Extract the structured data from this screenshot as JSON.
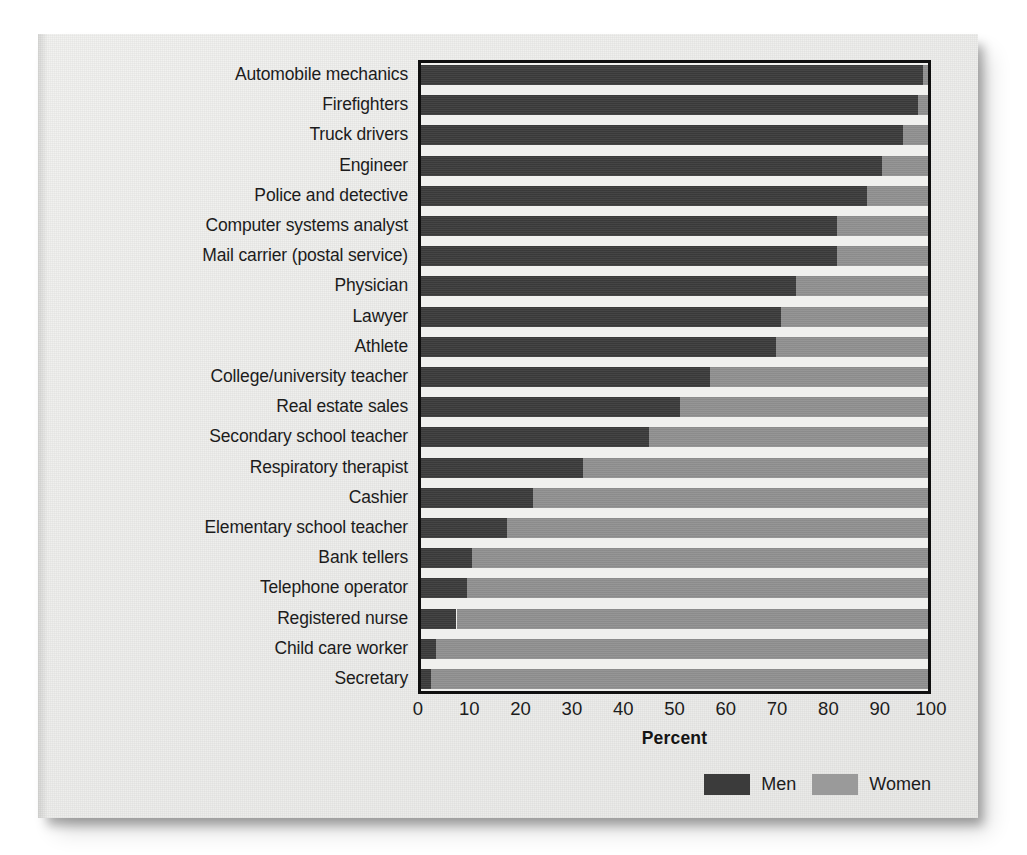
{
  "chart_data": {
    "type": "bar",
    "subtype": "stacked-horizontal-100",
    "title": "",
    "xlabel": "Percent",
    "ylabel": "",
    "xlim": [
      0,
      100
    ],
    "xticks": [
      0,
      10,
      20,
      30,
      40,
      50,
      60,
      70,
      80,
      90,
      100
    ],
    "grid": false,
    "legend_position": "bottom-right",
    "categories": [
      "Automobile mechanics",
      "Firefighters",
      "Truck drivers",
      "Engineer",
      "Police and detective",
      "Computer systems analyst",
      "Mail carrier (postal service)",
      "Physician",
      "Lawyer",
      "Athlete",
      "College/university teacher",
      "Real estate sales",
      "Secondary school teacher",
      "Respiratory therapist",
      "Cashier",
      "Elementary school teacher",
      "Bank tellers",
      "Telephone operator",
      "Registered nurse",
      "Child care worker",
      "Secretary"
    ],
    "series": [
      {
        "name": "Men",
        "color": "#3b3b3b",
        "values": [
          99,
          98,
          95,
          91,
          88,
          82,
          82,
          74,
          71,
          70,
          57,
          51,
          45,
          32,
          22,
          17,
          10,
          9,
          7,
          3,
          2
        ]
      },
      {
        "name": "Women",
        "color": "#909090",
        "values": [
          1,
          2,
          5,
          9,
          12,
          18,
          18,
          26,
          29,
          30,
          43,
          49,
          55,
          68,
          78,
          83,
          90,
          91,
          93,
          97,
          98
        ]
      }
    ]
  },
  "legend": {
    "entries": [
      {
        "label": "Men",
        "color": "#3b3b3b"
      },
      {
        "label": "Women",
        "color": "#9a9a9a"
      }
    ]
  }
}
